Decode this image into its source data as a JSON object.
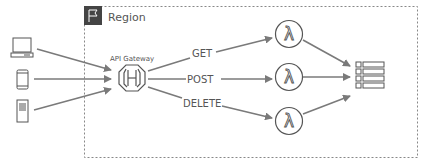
{
  "region": {
    "label": "Region",
    "icon": "flag-icon"
  },
  "clients": [
    {
      "name": "laptop",
      "icon": "laptop-icon"
    },
    {
      "name": "mobile",
      "icon": "mobile-phone-icon"
    },
    {
      "name": "server",
      "icon": "server-icon"
    }
  ],
  "gateway": {
    "label": "API Gateway",
    "icon": "api-gateway-icon"
  },
  "methods": [
    {
      "label": "GET"
    },
    {
      "label": "POST"
    },
    {
      "label": "DELETE"
    }
  ],
  "functions": [
    {
      "icon": "lambda-icon",
      "glyph": "λ"
    },
    {
      "icon": "lambda-icon",
      "glyph": "λ"
    },
    {
      "icon": "lambda-icon",
      "glyph": "λ"
    }
  ],
  "database": {
    "icon": "table-icon"
  },
  "colors": {
    "stroke": "#555555",
    "arrow": "#7a7a7a",
    "border": "#888888",
    "flag_bg": "#444444"
  }
}
